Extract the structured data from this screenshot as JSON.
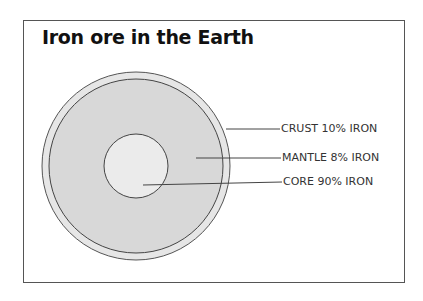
{
  "title": "Iron ore in the Earth",
  "layers": [
    {
      "name": "crust",
      "label": "CRUST 10% IRON",
      "iron_percent": 10
    },
    {
      "name": "mantle",
      "label": "MANTLE 8% IRON",
      "iron_percent": 8
    },
    {
      "name": "core",
      "label": "CORE 90% IRON",
      "iron_percent": 90
    }
  ],
  "colors": {
    "crust": "#e6e6e6",
    "mantle": "#d6d6d6",
    "core": "#e9e9e9",
    "line": "#444444"
  }
}
